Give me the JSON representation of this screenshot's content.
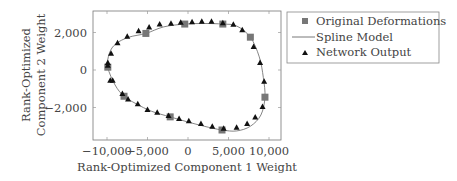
{
  "chart_data": {
    "type": "scatter",
    "title": "",
    "xlabel": "Rank-Optimized Component 1 Weight",
    "ylabel_lines": [
      "Rank-Optimized",
      "Component 2 Weight"
    ],
    "xlim": [
      -11000,
      11500
    ],
    "ylim": [
      -3800,
      3100
    ],
    "x_ticks": [
      -10000,
      -5000,
      0,
      5000,
      10000
    ],
    "x_tick_labels": [
      "−10,000",
      "−5,000",
      "0",
      "5,000",
      "10,000"
    ],
    "y_ticks": [
      2000,
      0,
      -2000
    ],
    "y_tick_labels": [
      "2,000",
      "0",
      "−2,000"
    ],
    "grid": false,
    "legend_position": "outside-right-top",
    "series": [
      {
        "name": "Original Deformations",
        "marker": "square",
        "color": "#777777",
        "points": [
          [
            -9900,
            150
          ],
          [
            -5200,
            1950
          ],
          [
            -400,
            2450
          ],
          [
            4300,
            2450
          ],
          [
            7700,
            1750
          ],
          [
            9500,
            -1450
          ],
          [
            4200,
            -3200
          ],
          [
            -2200,
            -2500
          ],
          [
            -7900,
            -1400
          ]
        ]
      },
      {
        "name": "Spline Model",
        "marker": "line",
        "color": "#666666",
        "points": [
          [
            -9900,
            150
          ],
          [
            -9700,
            900
          ],
          [
            -8900,
            1400
          ],
          [
            -7300,
            1750
          ],
          [
            -5200,
            1950
          ],
          [
            -3000,
            2300
          ],
          [
            -400,
            2450
          ],
          [
            2000,
            2480
          ],
          [
            4300,
            2450
          ],
          [
            6000,
            2350
          ],
          [
            7700,
            1750
          ],
          [
            8800,
            700
          ],
          [
            9300,
            -400
          ],
          [
            9500,
            -1450
          ],
          [
            9000,
            -2400
          ],
          [
            7700,
            -3000
          ],
          [
            6000,
            -3250
          ],
          [
            4200,
            -3200
          ],
          [
            2000,
            -3000
          ],
          [
            -200,
            -2750
          ],
          [
            -2200,
            -2500
          ],
          [
            -4500,
            -2200
          ],
          [
            -6400,
            -1800
          ],
          [
            -7900,
            -1400
          ],
          [
            -9000,
            -800
          ],
          [
            -9900,
            150
          ]
        ]
      },
      {
        "name": "Network Output",
        "marker": "triangle",
        "color": "#111111",
        "points": [
          [
            -9900,
            400
          ],
          [
            -9500,
            900
          ],
          [
            -8700,
            1450
          ],
          [
            -7500,
            1800
          ],
          [
            -6100,
            2100
          ],
          [
            -4800,
            2300
          ],
          [
            -3500,
            2450
          ],
          [
            -2100,
            2500
          ],
          [
            -900,
            2550
          ],
          [
            500,
            2580
          ],
          [
            1700,
            2600
          ],
          [
            2900,
            2600
          ],
          [
            4300,
            2520
          ],
          [
            5600,
            2440
          ],
          [
            6700,
            2150
          ],
          [
            8100,
            1250
          ],
          [
            8900,
            400
          ],
          [
            9400,
            -600
          ],
          [
            9200,
            -1950
          ],
          [
            8300,
            -2500
          ],
          [
            7300,
            -2850
          ],
          [
            6000,
            -3050
          ],
          [
            4400,
            -3100
          ],
          [
            3000,
            -3000
          ],
          [
            1600,
            -2850
          ],
          [
            100,
            -2700
          ],
          [
            -1100,
            -2580
          ],
          [
            -2400,
            -2420
          ],
          [
            -3800,
            -2250
          ],
          [
            -5000,
            -2100
          ],
          [
            -6200,
            -1800
          ],
          [
            -7400,
            -1550
          ],
          [
            -8100,
            -1250
          ],
          [
            -9300,
            -550
          ],
          [
            -9600,
            -550
          ],
          [
            -9900,
            250
          ]
        ]
      }
    ]
  },
  "legend": {
    "items": [
      {
        "label": "Original Deformations",
        "marker": "square"
      },
      {
        "label": "Spline Model",
        "marker": "line"
      },
      {
        "label": "Network Output",
        "marker": "triangle"
      }
    ]
  }
}
